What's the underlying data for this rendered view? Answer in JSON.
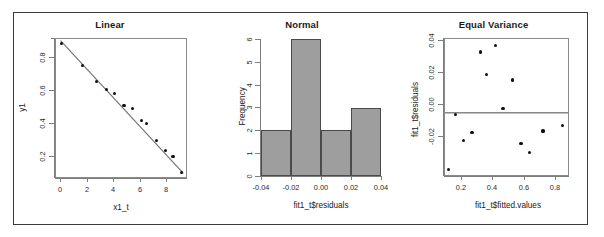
{
  "figure": {
    "background": "#ffffff",
    "border_color": "#3a3a3a",
    "width": 604,
    "height": 237,
    "panel_count": 3
  },
  "panels": [
    {
      "name": "linear",
      "title": "Linear",
      "xlabel": "x1_t",
      "ylabel": "y1",
      "xticks": [
        "0",
        "2",
        "4",
        "6",
        "8"
      ],
      "yticks": [
        "0.2",
        "0.4",
        "0.6",
        "0.8"
      ]
    },
    {
      "name": "normal",
      "title": "Normal",
      "xlabel": "fit1_t$residuals",
      "ylabel": "Frequency",
      "xticks": [
        "-0.04",
        "-0.02",
        "0.00",
        "0.02",
        "0.04"
      ],
      "yticks": [
        "0",
        "1",
        "2",
        "3",
        "4",
        "5",
        "6"
      ]
    },
    {
      "name": "equal-variance",
      "title": "Equal Variance",
      "xlabel": "fit1_t$fitted.values",
      "ylabel": "fit1_t$residuals",
      "xticks": [
        "0.2",
        "0.4",
        "0.6",
        "0.8"
      ],
      "yticks": [
        "-0.02",
        "0.00",
        "0.02",
        "0.04"
      ]
    }
  ],
  "chart_data": [
    {
      "type": "scatter",
      "name": "linear",
      "title": "Linear",
      "xlabel": "x1_t",
      "ylabel": "y1",
      "xlim": [
        -0.35,
        9.6
      ],
      "ylim": [
        0.04,
        0.865
      ],
      "xticks": [
        0,
        2,
        4,
        6,
        8
      ],
      "yticks": [
        0.2,
        0.4,
        0.6,
        0.8
      ],
      "grid": false,
      "legend": "none",
      "x": [
        0.1,
        1.7,
        2.75,
        3.5,
        4.1,
        4.85,
        5.5,
        6.2,
        6.6,
        7.35,
        8.05,
        8.6,
        9.25
      ],
      "y": [
        0.838,
        0.708,
        0.612,
        0.562,
        0.541,
        0.466,
        0.449,
        0.378,
        0.361,
        0.257,
        0.199,
        0.161,
        0.068
      ],
      "fit_line": {
        "type": "line",
        "x": [
          0.0,
          9.4
        ],
        "y": [
          0.855,
          0.062
        ]
      }
    },
    {
      "type": "bar",
      "name": "normal",
      "title": "Normal",
      "xlabel": "fit1_t$residuals",
      "ylabel": "Frequency",
      "categories": [
        "-0.04 to -0.02",
        "-0.02 to 0.00",
        "0.00 to 0.02",
        "0.02 to 0.04"
      ],
      "bin_edges": [
        -0.04,
        -0.02,
        0.0,
        0.02,
        0.04
      ],
      "values": [
        2,
        6,
        2,
        3
      ],
      "xlim": [
        -0.04,
        0.04
      ],
      "ylim": [
        0,
        6
      ],
      "xticks": [
        -0.04,
        -0.02,
        0.0,
        0.02,
        0.04
      ],
      "yticks": [
        0,
        1,
        2,
        3,
        4,
        5,
        6
      ],
      "bar_fill": "#9e9e9e",
      "bar_border": "#4a4a4a",
      "grid": false,
      "legend": "none"
    },
    {
      "type": "scatter",
      "name": "equal-variance",
      "title": "Equal Variance",
      "xlabel": "fit1_t$fitted.values",
      "ylabel": "fit1_t$residuals",
      "xlim": [
        0.095,
        0.885
      ],
      "ylim": [
        -0.0345,
        0.041
      ],
      "xticks": [
        0.2,
        0.4,
        0.6,
        0.8
      ],
      "yticks": [
        -0.02,
        0.0,
        0.02,
        0.04
      ],
      "grid": false,
      "legend": "none",
      "reference_line": {
        "type": "hline",
        "y": 0.0
      },
      "x": [
        0.115,
        0.163,
        0.215,
        0.268,
        0.325,
        0.362,
        0.418,
        0.468,
        0.53,
        0.583,
        0.637,
        0.725,
        0.852
      ],
      "y": [
        -0.0315,
        -0.0008,
        -0.0155,
        -0.0107,
        0.0338,
        0.0211,
        0.0373,
        0.0026,
        0.0182,
        -0.0172,
        -0.0219,
        -0.0101,
        -0.0071
      ]
    }
  ]
}
